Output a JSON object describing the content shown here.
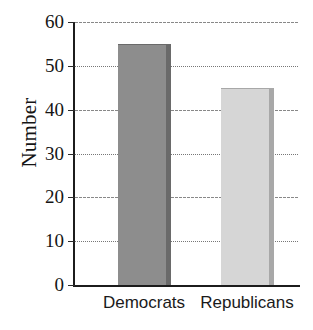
{
  "chart_data": {
    "type": "bar",
    "title": "",
    "subtitle": "",
    "xlabel": "",
    "ylabel": "Number",
    "categories": [
      "Democrats",
      "Republicans"
    ],
    "values": [
      55,
      45
    ],
    "series": [
      {
        "name": "Number",
        "values": [
          55,
          45
        ]
      }
    ],
    "ylim": [
      0,
      60
    ],
    "yticks": [
      0,
      10,
      20,
      30,
      40,
      50,
      60
    ],
    "ytick_labels": [
      "0",
      "10",
      "20",
      "30",
      "40",
      "50",
      "60"
    ],
    "grid": true,
    "grid_axis": "y",
    "grid_style": "dotted",
    "legend": false,
    "legend_position": "none",
    "bar_colors": [
      "#8d8d8d",
      "#d6d6d6"
    ],
    "bar_edge_colors": [
      "#6a6a6a",
      "#a8a8a8"
    ],
    "axis_color": "#1c1c1c",
    "grid_color": "#7a7a7a",
    "text_color": "#151515",
    "background": "#ffffff"
  }
}
